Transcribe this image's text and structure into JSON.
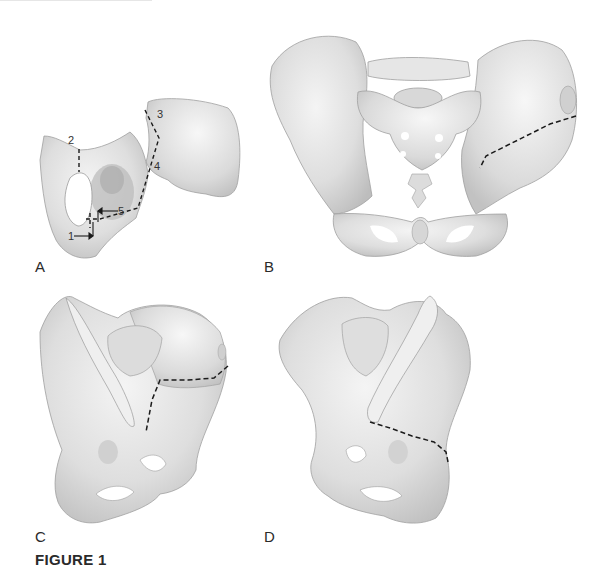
{
  "figure": {
    "caption": "FIGURE 1",
    "panels": [
      {
        "id": "A",
        "label": "A",
        "view": "lateral view of hemipelvis (innominate bone)",
        "annotations": [
          "1",
          "2",
          "3",
          "4",
          "5"
        ],
        "has_dashed_osteotomy_lines": true,
        "has_arrows": true
      },
      {
        "id": "B",
        "label": "B",
        "view": "anterior view of full pelvis with sacrum",
        "annotations": [],
        "has_dashed_osteotomy_lines": true
      },
      {
        "id": "C",
        "label": "C",
        "view": "oblique view of pelvis with osteotomy",
        "annotations": [],
        "has_dashed_osteotomy_lines": true
      },
      {
        "id": "D",
        "label": "D",
        "view": "oblique view of pelvis, opposite side with osteotomy",
        "annotations": [],
        "has_dashed_osteotomy_lines": true
      }
    ]
  },
  "colors": {
    "bone_fill": "#e4e4e4",
    "bone_shade": "#c8c8c8",
    "bone_outline": "#9a9a9a",
    "dash_line": "#1a1a1a",
    "background": "#ffffff"
  }
}
